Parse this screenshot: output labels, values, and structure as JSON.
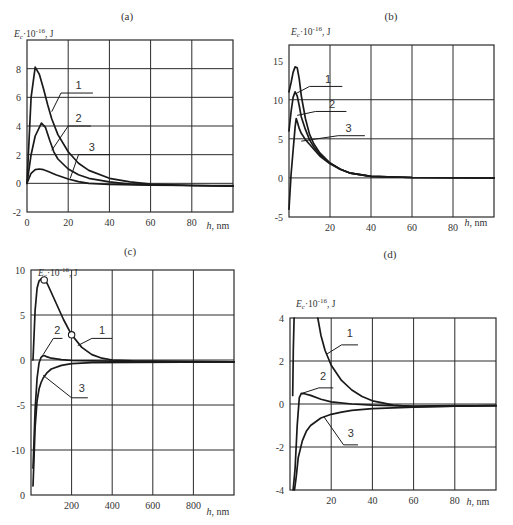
{
  "chart_data": [
    {
      "id": "a",
      "type": "line",
      "title": "(a)",
      "xlabel": "h, nm",
      "ylabel": "E_c·10^-16, J",
      "xlim": [
        0,
        100
      ],
      "ylim": [
        -2,
        10
      ],
      "xticks": [
        0,
        20,
        40,
        60,
        80
      ],
      "xtick_labels": [
        "0",
        "20",
        "40",
        "60",
        "80"
      ],
      "yticks": [
        -2,
        0,
        2,
        4,
        6,
        8
      ],
      "ytick_labels": [
        "-2",
        "0",
        "2",
        "4",
        "6",
        "8"
      ],
      "xgrid": [
        20,
        40,
        60,
        80
      ],
      "ygrid": [
        0,
        2,
        4,
        6,
        8
      ],
      "grid": true,
      "series": [
        {
          "name": "1",
          "x": [
            0,
            2,
            4,
            6,
            8,
            10,
            12,
            15,
            20,
            25,
            30,
            40,
            50,
            60,
            80,
            100
          ],
          "y": [
            0,
            6.0,
            8.1,
            7.6,
            6.6,
            5.5,
            4.5,
            3.4,
            2.2,
            1.4,
            0.9,
            0.35,
            0.1,
            -0.05,
            -0.15,
            -0.2
          ]
        },
        {
          "name": "2",
          "x": [
            0,
            2,
            4,
            7,
            9,
            11,
            13,
            15,
            20,
            25,
            30,
            40,
            50,
            60,
            80,
            100
          ],
          "y": [
            0,
            2.0,
            3.3,
            4.2,
            3.9,
            3.0,
            2.2,
            1.7,
            1.0,
            0.6,
            0.35,
            0.1,
            -0.05,
            -0.1,
            -0.15,
            -0.2
          ]
        },
        {
          "name": "3",
          "x": [
            0,
            2,
            4,
            6,
            8,
            10,
            14,
            20,
            25,
            30,
            40,
            60,
            80,
            100
          ],
          "y": [
            0,
            0.7,
            0.95,
            1.0,
            0.95,
            0.85,
            0.6,
            0.3,
            0.12,
            0.0,
            -0.08,
            -0.12,
            -0.15,
            -0.15
          ]
        }
      ],
      "annotations": [
        {
          "text": "1",
          "tip": [
            12,
            5.0
          ],
          "bar": [
            [
              16.5,
              6.3
            ],
            [
              32,
              6.3
            ]
          ],
          "label": [
            25,
            6.55
          ]
        },
        {
          "text": "2",
          "tip": [
            12,
            2.3
          ],
          "bar": [
            [
              20,
              4.0
            ],
            [
              31,
              4.0
            ]
          ],
          "label": [
            25,
            4.25
          ]
        },
        {
          "text": "3",
          "tip": [
            21,
            0.35
          ],
          "bar": [
            [
              25,
              2.0
            ],
            [
              40,
              2.0
            ]
          ],
          "label": [
            31.5,
            2.25
          ]
        }
      ]
    },
    {
      "id": "b",
      "type": "line",
      "title": "(b)",
      "xlabel": "h, nm",
      "ylabel": "E_c·10^-16, J",
      "xlim": [
        0,
        100
      ],
      "ylim": [
        -5,
        17
      ],
      "xticks": [
        20,
        40,
        60,
        80
      ],
      "xtick_labels": [
        "20",
        "40",
        "60",
        "80"
      ],
      "yticks": [
        -5,
        0,
        5,
        10,
        15
      ],
      "ytick_labels": [
        "-5",
        "0",
        "5",
        "10",
        "15"
      ],
      "xgrid": [
        20,
        40,
        60,
        80
      ],
      "ygrid": [
        0,
        5,
        10
      ],
      "grid": true,
      "series": [
        {
          "name": "1",
          "x": [
            0,
            1,
            2,
            3,
            4,
            5,
            6,
            8,
            10,
            12,
            15,
            20,
            25,
            30,
            40,
            60,
            100
          ],
          "y": [
            11,
            12.2,
            13.5,
            14.2,
            14.1,
            12.6,
            10.5,
            7.6,
            5.6,
            4.4,
            3.2,
            1.9,
            1.1,
            0.6,
            0.2,
            0.05,
            0.0
          ]
        },
        {
          "name": "2",
          "x": [
            0,
            1,
            2,
            3,
            4,
            5,
            6,
            8,
            10,
            12,
            15,
            20,
            25,
            30,
            40,
            60,
            100
          ],
          "y": [
            6,
            8.5,
            10.3,
            11.0,
            10.5,
            9.2,
            7.8,
            6.2,
            4.9,
            4.0,
            3.0,
            1.9,
            1.1,
            0.6,
            0.2,
            0.05,
            0.0
          ]
        },
        {
          "name": "3",
          "x": [
            0,
            1,
            2,
            3,
            3.5,
            4,
            5,
            6,
            8,
            10,
            12,
            15,
            20,
            25,
            30,
            40,
            60,
            100
          ],
          "y": [
            -4,
            0.5,
            3.5,
            6.5,
            7.6,
            7.2,
            6.3,
            5.7,
            4.9,
            4.3,
            3.7,
            2.8,
            1.8,
            1.1,
            0.6,
            0.2,
            0.05,
            0.0
          ]
        }
      ],
      "annotations": [
        {
          "text": "1",
          "tip": [
            3.5,
            10.8
          ],
          "bar": [
            [
              10,
              11.7
            ],
            [
              26,
              11.7
            ]
          ],
          "label": [
            19,
            12.2
          ]
        },
        {
          "text": "2",
          "tip": [
            4,
            8.0
          ],
          "bar": [
            [
              13,
              8.5
            ],
            [
              28,
              8.5
            ]
          ],
          "label": [
            21,
            9.0
          ]
        },
        {
          "text": "3",
          "tip": [
            6,
            4.7
          ],
          "bar": [
            [
              24,
              5.4
            ],
            [
              37,
              5.4
            ]
          ],
          "label": [
            29,
            5.9
          ]
        }
      ]
    },
    {
      "id": "c",
      "type": "line",
      "title": "(c)",
      "xlabel": "h, nm",
      "ylabel": "E_c·10^-16, J",
      "xlim": [
        0,
        1000
      ],
      "ylim": [
        -15,
        10
      ],
      "xticks": [
        200,
        400,
        600,
        800
      ],
      "xtick_labels": [
        "200",
        "400",
        "600",
        "800"
      ],
      "yticks": [
        -15,
        -10,
        -5,
        0,
        5,
        10
      ],
      "ytick_labels": [
        "0",
        "-10",
        "-5",
        "0",
        "5",
        "10"
      ],
      "xgrid": [
        200,
        400,
        600,
        800
      ],
      "ygrid": [
        -10,
        -5,
        0,
        5
      ],
      "grid": true,
      "series": [
        {
          "name": "1",
          "x": [
            10,
            20,
            30,
            40,
            50,
            60,
            70,
            80,
            100,
            130,
            160,
            200,
            250,
            300,
            350,
            400,
            500,
            700,
            1000
          ],
          "y": [
            0,
            5.5,
            8.0,
            8.8,
            9.0,
            9.0,
            8.8,
            8.5,
            7.5,
            6.0,
            4.5,
            2.8,
            1.4,
            0.6,
            0.2,
            0.0,
            -0.1,
            -0.15,
            -0.2
          ]
        },
        {
          "name": "2",
          "x": [
            10,
            15,
            20,
            30,
            40,
            50,
            60,
            70,
            80,
            100,
            150,
            200,
            300,
            500,
            1000
          ],
          "y": [
            -12,
            -9,
            -5.5,
            -2.0,
            -0.3,
            0.3,
            0.5,
            0.45,
            0.35,
            0.2,
            0.05,
            -0.05,
            -0.1,
            -0.15,
            -0.2
          ]
        },
        {
          "name": "3",
          "x": [
            10,
            15,
            20,
            30,
            40,
            50,
            60,
            80,
            100,
            150,
            200,
            300,
            500,
            1000
          ],
          "y": [
            -14,
            -11,
            -7.5,
            -4.5,
            -3.2,
            -2.5,
            -2.0,
            -1.4,
            -1.0,
            -0.6,
            -0.4,
            -0.3,
            -0.25,
            -0.2
          ]
        }
      ],
      "markers": [
        {
          "series": "1",
          "x": 65,
          "y": 8.9
        },
        {
          "series": "1",
          "x": 200,
          "y": 2.8
        }
      ],
      "annotations": [
        {
          "text": "1",
          "tip": [
            230,
            1.6
          ],
          "bar": [
            [
              300,
              2.4
            ],
            [
              400,
              2.4
            ]
          ],
          "label": [
            350,
            2.9
          ]
        },
        {
          "text": "2",
          "tip": [
            60,
            0.6
          ],
          "bar": [
            [
              110,
              2.4
            ],
            [
              155,
              2.4
            ]
          ],
          "label": [
            130,
            2.9
          ]
        },
        {
          "text": "3",
          "tip": [
            60,
            -1.7
          ],
          "bar": [
            [
              200,
              -4.2
            ],
            [
              280,
              -4.2
            ]
          ],
          "label": [
            250,
            -3.6
          ]
        }
      ]
    },
    {
      "id": "d",
      "type": "line",
      "title": "(d)",
      "xlabel": "h, nm",
      "ylabel": "E_c·10^-16, J",
      "xlim": [
        0,
        100
      ],
      "ylim": [
        -4,
        4
      ],
      "xticks": [
        20,
        40,
        60,
        80
      ],
      "xtick_labels": [
        "20",
        "40",
        "60",
        "80"
      ],
      "yticks": [
        -4,
        -2,
        0,
        2,
        4
      ],
      "ytick_labels": [
        "-4",
        "-2",
        "0",
        "2",
        "4"
      ],
      "xgrid": [
        20,
        40,
        60,
        80
      ],
      "ygrid": [
        -2,
        0,
        2
      ],
      "grid": true,
      "series": [
        {
          "name": "1",
          "x": [
            1.3,
            1.6,
            2.0
          ],
          "y": [
            0.4,
            2.5,
            4.0
          ]
        },
        {
          "name": "1b",
          "x": [
            13.5,
            15,
            17,
            20,
            25,
            30,
            35,
            40,
            45,
            50,
            60,
            80,
            100
          ],
          "y": [
            4.0,
            3.2,
            2.5,
            1.8,
            1.1,
            0.65,
            0.35,
            0.15,
            0.05,
            -0.05,
            -0.12,
            -0.1,
            -0.08
          ]
        },
        {
          "name": "2",
          "x": [
            1.5,
            2.5,
            3.5,
            4.5,
            5.5,
            7,
            10,
            15,
            20,
            30,
            40,
            60,
            80,
            100
          ],
          "y": [
            -4,
            -3.0,
            -1.0,
            0.3,
            0.5,
            0.48,
            0.4,
            0.22,
            0.1,
            0.0,
            -0.05,
            -0.1,
            -0.08,
            -0.07
          ]
        },
        {
          "name": "3",
          "x": [
            2.2,
            3,
            4,
            6,
            8,
            10,
            15,
            20,
            25,
            30,
            40,
            60,
            80,
            100
          ],
          "y": [
            -4,
            -3.4,
            -2.5,
            -1.7,
            -1.25,
            -1.0,
            -0.65,
            -0.48,
            -0.38,
            -0.3,
            -0.22,
            -0.15,
            -0.1,
            -0.08
          ]
        }
      ],
      "annotations": [
        {
          "text": "1",
          "tip": [
            17.5,
            2.3
          ],
          "bar": [
            [
              25,
              2.75
            ],
            [
              33,
              2.75
            ]
          ],
          "label": [
            29,
            3.1
          ]
        },
        {
          "text": "2",
          "tip": [
            6,
            0.5
          ],
          "bar": [
            [
              14,
              0.75
            ],
            [
              21,
              0.75
            ]
          ],
          "label": [
            16,
            1.1
          ]
        },
        {
          "text": "3",
          "tip": [
            16.5,
            -0.6
          ],
          "bar": [
            [
              26,
              -1.9
            ],
            [
              33,
              -1.9
            ]
          ],
          "label": [
            29.5,
            -1.55
          ]
        }
      ]
    }
  ],
  "panels": [
    {
      "id": "a",
      "box": [
        27,
        40,
        233,
        212
      ],
      "title_pos": [
        127,
        20
      ],
      "ylabel_pos": [
        14,
        37
      ],
      "xlabel_pos": [
        218,
        229
      ]
    },
    {
      "id": "b",
      "box": [
        289,
        45,
        494,
        217
      ],
      "title_pos": [
        391,
        20
      ],
      "ylabel_pos": [
        291,
        35
      ],
      "xlabel_pos": [
        476,
        226
      ]
    },
    {
      "id": "c",
      "box": [
        31,
        270,
        234,
        495
      ],
      "title_pos": [
        130,
        255
      ],
      "ylabel_pos": [
        38,
        276
      ],
      "xlabel_pos": [
        218,
        515
      ]
    },
    {
      "id": "d",
      "box": [
        290,
        318,
        496,
        490
      ],
      "title_pos": [
        390,
        258
      ],
      "ylabel_pos": [
        296,
        307
      ],
      "xlabel_pos": [
        478,
        505
      ]
    }
  ],
  "style": {
    "line_color": "#1a1a1a",
    "grid_color": "#2a2a2a",
    "background": "#ffffff"
  }
}
